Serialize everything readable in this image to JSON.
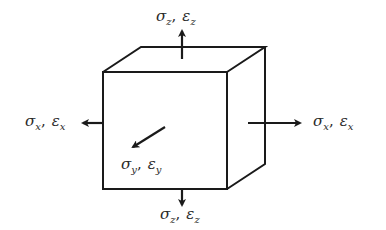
{
  "diagram": {
    "title": "",
    "colors": {
      "line": "#1a1a1a",
      "text": "#2a2a2a",
      "background": "#ffffff"
    },
    "cube": {
      "front_face": {
        "x1": 103,
        "y1": 72,
        "x2": 227,
        "y2": 189
      },
      "depth_offset": {
        "dx": 38,
        "dy": -25
      }
    },
    "labels": {
      "top": {
        "sigma": "σ",
        "sigma_sub": "z",
        "eps": "ε",
        "eps_sub": "z",
        "sep": ","
      },
      "bottom": {
        "sigma": "σ",
        "sigma_sub": "z",
        "eps": "ε",
        "eps_sub": "z",
        "sep": ","
      },
      "left": {
        "sigma": "σ",
        "sigma_sub": "x",
        "eps": "ε",
        "eps_sub": "x",
        "sep": ","
      },
      "right": {
        "sigma": "σ",
        "sigma_sub": "x",
        "eps": "ε",
        "eps_sub": "x",
        "sep": ","
      },
      "front": {
        "sigma": "σ",
        "sigma_sub": "y",
        "eps": "ε",
        "eps_sub": "y",
        "sep": ","
      }
    },
    "arrows": [
      {
        "name": "arrow-z-up",
        "direction": "up"
      },
      {
        "name": "arrow-z-down",
        "direction": "down"
      },
      {
        "name": "arrow-x-left",
        "direction": "left"
      },
      {
        "name": "arrow-x-right",
        "direction": "right"
      },
      {
        "name": "arrow-y-front",
        "direction": "diagonal-down-left"
      }
    ]
  }
}
